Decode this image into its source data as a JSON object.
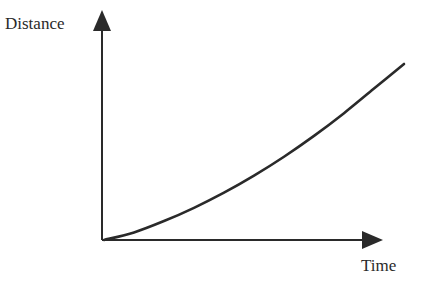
{
  "chart_data": {
    "type": "line",
    "title": "",
    "xlabel": "Time",
    "ylabel": "Distance",
    "grid": false,
    "legend": null,
    "ticks": {
      "x": [],
      "y": []
    },
    "series": [
      {
        "name": "distance",
        "x": [
          0,
          0.1,
          0.2,
          0.3,
          0.4,
          0.5,
          0.6,
          0.7,
          0.8,
          0.9,
          1.0
        ],
        "values": [
          0,
          0.04,
          0.1,
          0.17,
          0.25,
          0.34,
          0.44,
          0.55,
          0.67,
          0.8,
          0.93
        ]
      }
    ],
    "xlim": [
      0,
      1.1
    ],
    "ylim": [
      0,
      1.1
    ]
  },
  "colors": {
    "ink": "#2a2a2a",
    "background": "#ffffff"
  }
}
